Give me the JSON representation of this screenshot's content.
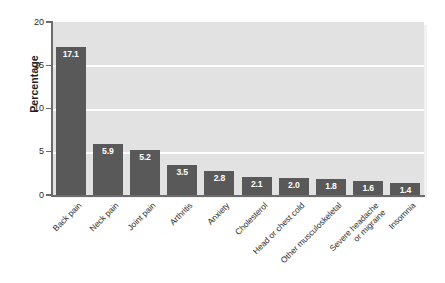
{
  "chart_data": {
    "type": "bar",
    "title": "",
    "xlabel": "",
    "ylabel": "Percentage",
    "ylim": [
      0,
      20
    ],
    "yticks": [
      0,
      5,
      10,
      15,
      20
    ],
    "ytick_labels": [
      "0",
      "5",
      "10",
      "15",
      "20"
    ],
    "grid": "horizontal",
    "legend": "none",
    "categories": [
      "Back pain",
      "Neck pain",
      "Joint pain",
      "Arthritis",
      "Anxiety",
      "Cholesterol",
      "Head or chest cold",
      "Other musculoskeletal",
      "Severe headache\nor migraine",
      "Insomnia"
    ],
    "values": [
      17.1,
      5.9,
      5.2,
      3.5,
      2.8,
      2.1,
      2.0,
      1.8,
      1.6,
      1.4
    ],
    "value_labels": [
      "17.1",
      "5.9",
      "5.2",
      "3.5",
      "2.8",
      "2.1",
      "2.0",
      "1.8",
      "1.6",
      "1.4"
    ],
    "bar_color": "#595959",
    "plot_background": "#e2e2e2",
    "gridline_color": "#ffffff",
    "axis_color": "#6b6b6b",
    "value_label_color": "#ffffff",
    "figure_background": "#ffffff"
  }
}
